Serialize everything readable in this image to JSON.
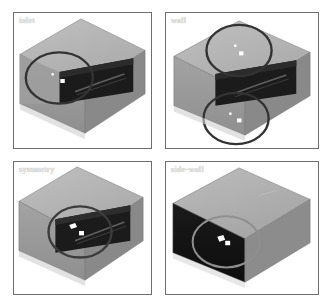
{
  "figure": {
    "title": "",
    "background_color": "#ffffff",
    "layout": "2x2 grid of isometric box views",
    "panel_border_color": "#6e6e6e",
    "label_color": "#f2f2f2"
  },
  "colors": {
    "box_top_face": "#b4b4b4",
    "box_front_face_light": "#9a9a9a",
    "box_side_face": "#8c8c8c",
    "box_interior_dark": "#1c1c1c",
    "box_dark_face": "#141414",
    "highlight_ellipse_dark": "#3a3a3a",
    "highlight_ellipse_light": "#9a9a9a",
    "marker_white": "#ffffff",
    "edge_line": "#6b6b6b"
  },
  "panels": [
    {
      "id": "inlet",
      "label": "inlet",
      "position": "top-left",
      "shading": "light",
      "highlights": [
        {
          "name": "inlet-face-highlight",
          "cx": 46,
          "cy": 66,
          "rx": 34,
          "ry": 26,
          "style": "dark",
          "markers": [
            {
              "x": 39,
              "y": 62,
              "w": 2,
              "h": 2
            },
            {
              "x": 48,
              "y": 68,
              "w": 4,
              "h": 4
            }
          ]
        }
      ]
    },
    {
      "id": "wall",
      "label": "wall",
      "position": "top-right",
      "shading": "light",
      "highlights": [
        {
          "name": "wall-top-highlight",
          "cx": 74,
          "cy": 38,
          "rx": 33,
          "ry": 26,
          "style": "dark",
          "markers": [
            {
              "x": 70,
              "y": 33,
              "w": 2,
              "h": 2
            },
            {
              "x": 75,
              "y": 40,
              "w": 4,
              "h": 4
            }
          ]
        },
        {
          "name": "wall-bottom-highlight",
          "cx": 71,
          "cy": 107,
          "rx": 33,
          "ry": 26,
          "style": "dark",
          "markers": [
            {
              "x": 65,
              "y": 102,
              "w": 2,
              "h": 2
            },
            {
              "x": 73,
              "y": 108,
              "w": 4,
              "h": 4
            }
          ]
        }
      ]
    },
    {
      "id": "symmetry",
      "label": "symmetry",
      "position": "bottom-left",
      "shading": "light",
      "highlights": [
        {
          "name": "symmetry-interior-highlight",
          "cx": 67,
          "cy": 71,
          "rx": 32,
          "ry": 26,
          "style": "dark",
          "markers": [
            {
              "x": 59,
              "y": 66,
              "w": 3,
              "h": 3
            },
            {
              "x": 67,
              "y": 72,
              "w": 5,
              "h": 4
            }
          ]
        }
      ]
    },
    {
      "id": "side-wall",
      "label": "side-wall",
      "position": "bottom-right",
      "shading": "dark",
      "highlights": [
        {
          "name": "sidewall-face-highlight",
          "cx": 61,
          "cy": 81,
          "rx": 34,
          "ry": 26,
          "style": "light",
          "markers": [
            {
              "x": 55,
              "y": 76,
              "w": 3,
              "h": 3
            },
            {
              "x": 62,
              "y": 82,
              "w": 5,
              "h": 4
            }
          ]
        }
      ]
    }
  ]
}
